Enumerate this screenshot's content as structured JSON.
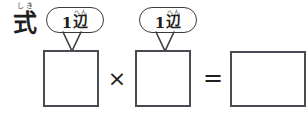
{
  "worksheet": {
    "width": 308,
    "height": 120,
    "background_color": "#ffffff",
    "ink_color": "#1f1f1f",
    "box_border_color": "#4a4a52",
    "bubble_border_color": "#3a3a3a"
  },
  "row_label": {
    "furigana": "しき",
    "base": "式"
  },
  "callouts": [
    {
      "id": "callout-left",
      "number": "1",
      "furigana": "へん",
      "base": "辺",
      "full_text": "1辺"
    },
    {
      "id": "callout-right",
      "number": "1",
      "furigana": "へん",
      "base": "辺",
      "full_text": "1辺"
    }
  ],
  "equation": {
    "operand_1": "",
    "operator_1": "×",
    "operand_2": "",
    "operator_2": "=",
    "result": ""
  },
  "boxes": [
    {
      "id": "operand-1-box",
      "value": "",
      "x": 43,
      "y": 50,
      "width": 56,
      "height": 57
    },
    {
      "id": "operand-2-box",
      "value": "",
      "x": 135,
      "y": 50,
      "width": 56,
      "height": 57
    },
    {
      "id": "result-box",
      "value": "",
      "x": 230,
      "y": 51,
      "width": 76,
      "height": 56
    }
  ]
}
